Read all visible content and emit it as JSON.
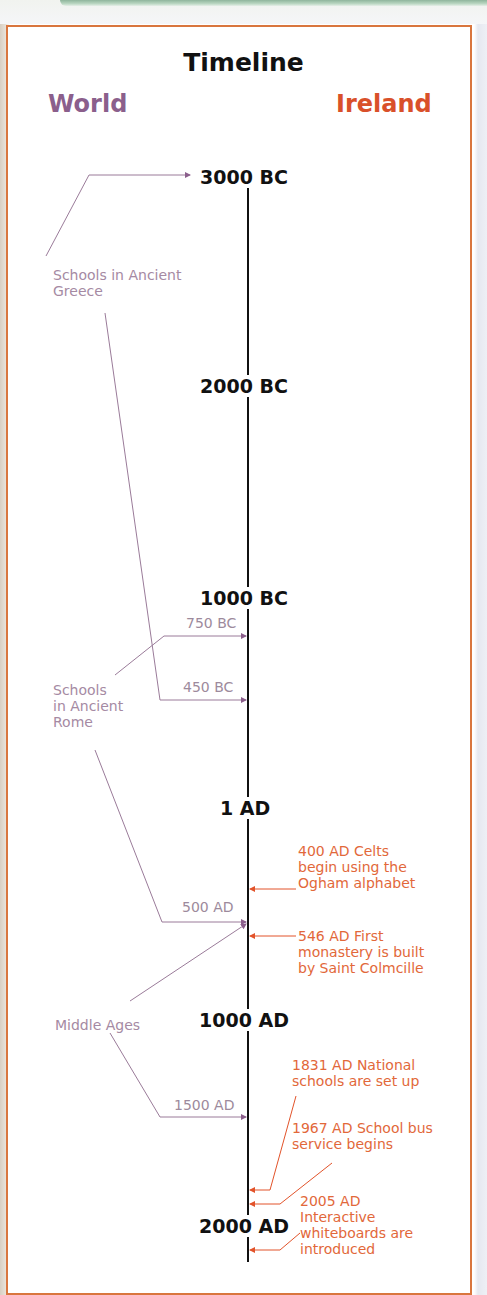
{
  "title": "Timeline",
  "columns": {
    "world": "World",
    "ireland": "Ireland"
  },
  "colors": {
    "world": "#8b5f8c",
    "ireland": "#d9502a",
    "frame": "#d9763e",
    "axis": "#111111"
  },
  "eras": [
    {
      "label": "3000 BC"
    },
    {
      "label": "2000 BC"
    },
    {
      "label": "1000 BC"
    },
    {
      "label": "1 AD"
    },
    {
      "label": "1000 AD"
    },
    {
      "label": "2000 AD"
    }
  ],
  "world_events": [
    {
      "label": "Schools in Ancient Greece",
      "lines": [
        "Schools in Ancient",
        "Greece"
      ],
      "dates": [
        "3000 BC",
        "450 BC"
      ]
    },
    {
      "label": "Schools in Ancient Rome",
      "lines": [
        "Schools",
        "in Ancient",
        "Rome"
      ],
      "dates": [
        "750 BC",
        "500 AD"
      ]
    },
    {
      "label": "Middle Ages",
      "lines": [
        "Middle Ages"
      ],
      "dates": [
        "500 AD",
        "1500 AD"
      ]
    }
  ],
  "world_dates": {
    "d750bc": "750 BC",
    "d450bc": "450 BC",
    "d500ad": "500 AD",
    "d1500ad": "1500 AD"
  },
  "ireland_events": [
    {
      "year": "400 AD",
      "lines": [
        "400 AD Celts",
        "begin using the",
        "Ogham alphabet"
      ]
    },
    {
      "year": "546 AD",
      "lines": [
        "546 AD First",
        "monastery is built",
        "by Saint Colmcille"
      ]
    },
    {
      "year": "1831 AD",
      "lines": [
        "1831 AD National",
        "schools are set up"
      ]
    },
    {
      "year": "1967 AD",
      "lines": [
        "1967 AD School bus",
        "service begins"
      ]
    },
    {
      "year": "2005 AD",
      "lines": [
        "2005 AD",
        "Interactive",
        "whiteboards are",
        "introduced"
      ]
    }
  ]
}
